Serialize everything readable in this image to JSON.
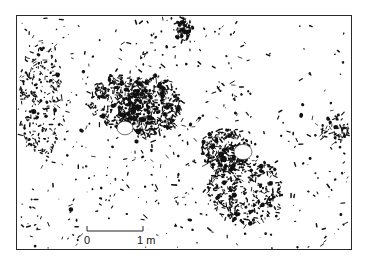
{
  "figure": {
    "type": "archaeological distribution plan",
    "frame": {
      "x": 16,
      "y": 15,
      "width": 336,
      "height": 235,
      "stroke": "#2a2a2a"
    },
    "ink_color": "#111111",
    "background": "#ffffff"
  },
  "scale_bar": {
    "start_label": "0",
    "end_label": "1 m",
    "x_start": 87,
    "x_end": 143,
    "y": 231,
    "tick_height": 5
  },
  "concentrations": [
    {
      "name": "upper-centre-dense-cluster",
      "cx": 150,
      "cy": 105,
      "rx": 32,
      "ry": 30,
      "density": 0.9
    },
    {
      "name": "left-ring-cluster",
      "cx": 118,
      "cy": 100,
      "rx": 28,
      "ry": 26,
      "density": 0.55
    },
    {
      "name": "lower-right-dense-cluster",
      "cx": 225,
      "cy": 150,
      "rx": 24,
      "ry": 22,
      "density": 0.8
    },
    {
      "name": "lower-right-ring-cluster",
      "cx": 245,
      "cy": 190,
      "rx": 38,
      "ry": 34,
      "density": 0.5
    },
    {
      "name": "top-centre-cluster",
      "cx": 183,
      "cy": 28,
      "rx": 10,
      "ry": 12,
      "density": 0.7
    },
    {
      "name": "right-edge-cluster",
      "cx": 335,
      "cy": 130,
      "rx": 14,
      "ry": 14,
      "density": 0.45
    },
    {
      "name": "left-edge-scatter",
      "cx": 40,
      "cy": 100,
      "rx": 22,
      "ry": 60,
      "density": 0.3
    }
  ],
  "voids": [
    {
      "name": "hearth-void-upper",
      "cx": 125,
      "cy": 128,
      "r": 8
    },
    {
      "name": "hearth-void-lower",
      "cx": 243,
      "cy": 152,
      "r": 9
    }
  ],
  "background_scatter_count": 520
}
